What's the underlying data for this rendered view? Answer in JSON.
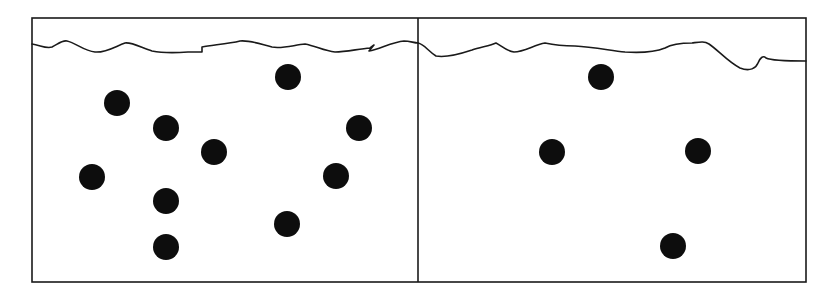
{
  "diagram": {
    "colors": {
      "line": "#1a1a1a",
      "particle": "#0d0d0d",
      "background": "#ffffff"
    },
    "container": {
      "outer_box": {
        "x": 32,
        "y": 18,
        "width": 774,
        "height": 264
      },
      "divider_x": 418
    },
    "compartments": [
      {
        "name": "left",
        "particle_count": 10,
        "particles": [
          {
            "cx": 117,
            "cy": 103
          },
          {
            "cx": 166,
            "cy": 128
          },
          {
            "cx": 214,
            "cy": 152
          },
          {
            "cx": 92,
            "cy": 177
          },
          {
            "cx": 166,
            "cy": 201
          },
          {
            "cx": 166,
            "cy": 247
          },
          {
            "cx": 288,
            "cy": 77
          },
          {
            "cx": 359,
            "cy": 128
          },
          {
            "cx": 336,
            "cy": 176
          },
          {
            "cx": 287,
            "cy": 224
          }
        ]
      },
      {
        "name": "right",
        "particle_count": 4,
        "particles": [
          {
            "cx": 601,
            "cy": 77
          },
          {
            "cx": 552,
            "cy": 152
          },
          {
            "cx": 698,
            "cy": 151
          },
          {
            "cx": 673,
            "cy": 246
          }
        ]
      }
    ],
    "particle_radius": 13
  }
}
